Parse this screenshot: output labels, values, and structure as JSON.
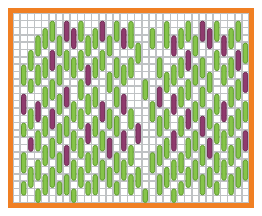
{
  "figure": {
    "title": "",
    "background": "#ffffff"
  },
  "frame": {
    "name": "orange-border-frame",
    "color": "#F07F23",
    "thickness": 5,
    "x": 8,
    "y": 8,
    "width": 246,
    "height": 200
  },
  "plot": {
    "x": 13,
    "y": 13,
    "width": 236,
    "height": 190,
    "background": "#ffffff"
  },
  "grid": {
    "color": "#BFC2C4",
    "line_width": 1.6,
    "columns": 33,
    "rows": 26,
    "cell_width": 7.15,
    "cell_height": 7.3,
    "visible": true
  },
  "colors": {
    "green_fill": "#86C44A",
    "green_stroke": "#5E9B2C",
    "purple_fill": "#8F3B6E",
    "purple_stroke": "#6E2A53",
    "grid": "#BFC2C4",
    "border": "#F07F23",
    "background": "#ffffff"
  },
  "chart_data": {
    "type": "heatmap",
    "title": "",
    "xlabel": "",
    "ylabel": "",
    "legend": [
      {
        "label": "green-capsule",
        "color": "#86C44A"
      },
      {
        "label": "purple-capsule",
        "color": "#8F3B6E"
      }
    ],
    "grid_columns": 33,
    "grid_rows": 26,
    "marks": [
      {
        "col": 1,
        "row": 7,
        "len": 3,
        "color": "green"
      },
      {
        "col": 1,
        "row": 11,
        "len": 3,
        "color": "purple"
      },
      {
        "col": 1,
        "row": 15,
        "len": 2,
        "color": "green"
      },
      {
        "col": 1,
        "row": 19,
        "len": 3,
        "color": "green"
      },
      {
        "col": 1,
        "row": 23,
        "len": 2,
        "color": "green"
      },
      {
        "col": 2,
        "row": 5,
        "len": 3,
        "color": "green"
      },
      {
        "col": 2,
        "row": 9,
        "len": 2,
        "color": "green"
      },
      {
        "col": 2,
        "row": 13,
        "len": 3,
        "color": "green"
      },
      {
        "col": 2,
        "row": 17,
        "len": 2,
        "color": "purple"
      },
      {
        "col": 2,
        "row": 21,
        "len": 3,
        "color": "green"
      },
      {
        "col": 3,
        "row": 3,
        "len": 3,
        "color": "green"
      },
      {
        "col": 3,
        "row": 7,
        "len": 3,
        "color": "green"
      },
      {
        "col": 3,
        "row": 12,
        "len": 3,
        "color": "purple"
      },
      {
        "col": 3,
        "row": 16,
        "len": 3,
        "color": "green"
      },
      {
        "col": 3,
        "row": 20,
        "len": 3,
        "color": "green"
      },
      {
        "col": 3,
        "row": 24,
        "len": 2,
        "color": "green"
      },
      {
        "col": 4,
        "row": 2,
        "len": 3,
        "color": "green"
      },
      {
        "col": 4,
        "row": 6,
        "len": 3,
        "color": "green"
      },
      {
        "col": 4,
        "row": 10,
        "len": 3,
        "color": "green"
      },
      {
        "col": 4,
        "row": 14,
        "len": 3,
        "color": "green"
      },
      {
        "col": 4,
        "row": 18,
        "len": 3,
        "color": "green"
      },
      {
        "col": 4,
        "row": 22,
        "len": 3,
        "color": "green"
      },
      {
        "col": 5,
        "row": 1,
        "len": 3,
        "color": "green"
      },
      {
        "col": 5,
        "row": 5,
        "len": 3,
        "color": "purple"
      },
      {
        "col": 5,
        "row": 9,
        "len": 3,
        "color": "green"
      },
      {
        "col": 5,
        "row": 13,
        "len": 3,
        "color": "purple"
      },
      {
        "col": 5,
        "row": 17,
        "len": 3,
        "color": "green"
      },
      {
        "col": 5,
        "row": 21,
        "len": 3,
        "color": "green"
      },
      {
        "col": 6,
        "row": 3,
        "len": 3,
        "color": "green"
      },
      {
        "col": 6,
        "row": 7,
        "len": 3,
        "color": "green"
      },
      {
        "col": 6,
        "row": 11,
        "len": 3,
        "color": "green"
      },
      {
        "col": 6,
        "row": 15,
        "len": 3,
        "color": "green"
      },
      {
        "col": 6,
        "row": 19,
        "len": 3,
        "color": "green"
      },
      {
        "col": 6,
        "row": 23,
        "len": 2,
        "color": "green"
      },
      {
        "col": 7,
        "row": 1,
        "len": 3,
        "color": "purple"
      },
      {
        "col": 7,
        "row": 5,
        "len": 3,
        "color": "green"
      },
      {
        "col": 7,
        "row": 10,
        "len": 3,
        "color": "purple"
      },
      {
        "col": 7,
        "row": 14,
        "len": 3,
        "color": "green"
      },
      {
        "col": 7,
        "row": 18,
        "len": 3,
        "color": "purple"
      },
      {
        "col": 7,
        "row": 22,
        "len": 3,
        "color": "green"
      },
      {
        "col": 8,
        "row": 2,
        "len": 3,
        "color": "purple"
      },
      {
        "col": 8,
        "row": 6,
        "len": 3,
        "color": "green"
      },
      {
        "col": 8,
        "row": 12,
        "len": 3,
        "color": "green"
      },
      {
        "col": 8,
        "row": 16,
        "len": 3,
        "color": "green"
      },
      {
        "col": 8,
        "row": 20,
        "len": 3,
        "color": "green"
      },
      {
        "col": 8,
        "row": 24,
        "len": 2,
        "color": "green"
      },
      {
        "col": 9,
        "row": 1,
        "len": 3,
        "color": "green"
      },
      {
        "col": 9,
        "row": 5,
        "len": 3,
        "color": "green"
      },
      {
        "col": 9,
        "row": 9,
        "len": 3,
        "color": "green"
      },
      {
        "col": 9,
        "row": 13,
        "len": 3,
        "color": "green"
      },
      {
        "col": 9,
        "row": 17,
        "len": 3,
        "color": "green"
      },
      {
        "col": 9,
        "row": 21,
        "len": 3,
        "color": "green"
      },
      {
        "col": 10,
        "row": 3,
        "len": 3,
        "color": "green"
      },
      {
        "col": 10,
        "row": 7,
        "len": 3,
        "color": "purple"
      },
      {
        "col": 10,
        "row": 11,
        "len": 3,
        "color": "green"
      },
      {
        "col": 10,
        "row": 15,
        "len": 3,
        "color": "purple"
      },
      {
        "col": 10,
        "row": 19,
        "len": 3,
        "color": "green"
      },
      {
        "col": 10,
        "row": 23,
        "len": 2,
        "color": "green"
      },
      {
        "col": 11,
        "row": 2,
        "len": 3,
        "color": "green"
      },
      {
        "col": 11,
        "row": 6,
        "len": 3,
        "color": "green"
      },
      {
        "col": 11,
        "row": 10,
        "len": 3,
        "color": "green"
      },
      {
        "col": 11,
        "row": 14,
        "len": 3,
        "color": "green"
      },
      {
        "col": 11,
        "row": 18,
        "len": 3,
        "color": "green"
      },
      {
        "col": 11,
        "row": 22,
        "len": 3,
        "color": "green"
      },
      {
        "col": 12,
        "row": 1,
        "len": 3,
        "color": "purple"
      },
      {
        "col": 12,
        "row": 5,
        "len": 3,
        "color": "green"
      },
      {
        "col": 12,
        "row": 12,
        "len": 3,
        "color": "purple"
      },
      {
        "col": 12,
        "row": 16,
        "len": 3,
        "color": "green"
      },
      {
        "col": 12,
        "row": 20,
        "len": 3,
        "color": "green"
      },
      {
        "col": 13,
        "row": 3,
        "len": 3,
        "color": "green"
      },
      {
        "col": 13,
        "row": 8,
        "len": 3,
        "color": "green"
      },
      {
        "col": 13,
        "row": 13,
        "len": 3,
        "color": "green"
      },
      {
        "col": 13,
        "row": 17,
        "len": 3,
        "color": "purple"
      },
      {
        "col": 13,
        "row": 21,
        "len": 3,
        "color": "green"
      },
      {
        "col": 14,
        "row": 1,
        "len": 3,
        "color": "green"
      },
      {
        "col": 14,
        "row": 6,
        "len": 3,
        "color": "green"
      },
      {
        "col": 14,
        "row": 10,
        "len": 3,
        "color": "green"
      },
      {
        "col": 14,
        "row": 14,
        "len": 3,
        "color": "green"
      },
      {
        "col": 14,
        "row": 19,
        "len": 3,
        "color": "green"
      },
      {
        "col": 14,
        "row": 23,
        "len": 2,
        "color": "green"
      },
      {
        "col": 15,
        "row": 2,
        "len": 3,
        "color": "purple"
      },
      {
        "col": 15,
        "row": 7,
        "len": 3,
        "color": "green"
      },
      {
        "col": 15,
        "row": 11,
        "len": 3,
        "color": "purple"
      },
      {
        "col": 15,
        "row": 16,
        "len": 3,
        "color": "purple"
      },
      {
        "col": 15,
        "row": 20,
        "len": 3,
        "color": "green"
      },
      {
        "col": 16,
        "row": 1,
        "len": 4,
        "color": "green"
      },
      {
        "col": 16,
        "row": 6,
        "len": 3,
        "color": "green"
      },
      {
        "col": 16,
        "row": 13,
        "len": 3,
        "color": "green"
      },
      {
        "col": 16,
        "row": 18,
        "len": 3,
        "color": "green"
      },
      {
        "col": 16,
        "row": 22,
        "len": 3,
        "color": "green"
      },
      {
        "col": 17,
        "row": 4,
        "len": 3,
        "color": "green"
      },
      {
        "col": 17,
        "row": 15,
        "len": 3,
        "color": "purple"
      },
      {
        "col": 17,
        "row": 21,
        "len": 3,
        "color": "green"
      },
      {
        "col": 18,
        "row": 9,
        "len": 3,
        "color": "green"
      },
      {
        "col": 18,
        "row": 24,
        "len": 2,
        "color": "green"
      },
      {
        "col": 19,
        "row": 2,
        "len": 3,
        "color": "green"
      },
      {
        "col": 19,
        "row": 12,
        "len": 3,
        "color": "green"
      },
      {
        "col": 19,
        "row": 19,
        "len": 3,
        "color": "green"
      },
      {
        "col": 20,
        "row": 6,
        "len": 3,
        "color": "green"
      },
      {
        "col": 20,
        "row": 10,
        "len": 3,
        "color": "purple"
      },
      {
        "col": 20,
        "row": 14,
        "len": 3,
        "color": "green"
      },
      {
        "col": 20,
        "row": 18,
        "len": 3,
        "color": "green"
      },
      {
        "col": 20,
        "row": 22,
        "len": 3,
        "color": "green"
      },
      {
        "col": 21,
        "row": 1,
        "len": 4,
        "color": "green"
      },
      {
        "col": 21,
        "row": 8,
        "len": 3,
        "color": "green"
      },
      {
        "col": 21,
        "row": 13,
        "len": 3,
        "color": "green"
      },
      {
        "col": 21,
        "row": 17,
        "len": 3,
        "color": "green"
      },
      {
        "col": 21,
        "row": 21,
        "len": 3,
        "color": "green"
      },
      {
        "col": 22,
        "row": 3,
        "len": 3,
        "color": "purple"
      },
      {
        "col": 22,
        "row": 7,
        "len": 3,
        "color": "green"
      },
      {
        "col": 22,
        "row": 11,
        "len": 3,
        "color": "purple"
      },
      {
        "col": 22,
        "row": 16,
        "len": 3,
        "color": "purple"
      },
      {
        "col": 22,
        "row": 20,
        "len": 3,
        "color": "green"
      },
      {
        "col": 22,
        "row": 24,
        "len": 2,
        "color": "green"
      },
      {
        "col": 23,
        "row": 2,
        "len": 3,
        "color": "green"
      },
      {
        "col": 23,
        "row": 6,
        "len": 3,
        "color": "green"
      },
      {
        "col": 23,
        "row": 10,
        "len": 3,
        "color": "green"
      },
      {
        "col": 23,
        "row": 14,
        "len": 3,
        "color": "green"
      },
      {
        "col": 23,
        "row": 19,
        "len": 3,
        "color": "green"
      },
      {
        "col": 23,
        "row": 23,
        "len": 2,
        "color": "green"
      },
      {
        "col": 24,
        "row": 1,
        "len": 3,
        "color": "green"
      },
      {
        "col": 24,
        "row": 5,
        "len": 3,
        "color": "purple"
      },
      {
        "col": 24,
        "row": 9,
        "len": 3,
        "color": "green"
      },
      {
        "col": 24,
        "row": 13,
        "len": 3,
        "color": "purple"
      },
      {
        "col": 24,
        "row": 17,
        "len": 3,
        "color": "green"
      },
      {
        "col": 24,
        "row": 21,
        "len": 3,
        "color": "green"
      },
      {
        "col": 25,
        "row": 3,
        "len": 3,
        "color": "green"
      },
      {
        "col": 25,
        "row": 7,
        "len": 3,
        "color": "green"
      },
      {
        "col": 25,
        "row": 12,
        "len": 3,
        "color": "green"
      },
      {
        "col": 25,
        "row": 16,
        "len": 3,
        "color": "green"
      },
      {
        "col": 25,
        "row": 20,
        "len": 3,
        "color": "green"
      },
      {
        "col": 26,
        "row": 1,
        "len": 3,
        "color": "purple"
      },
      {
        "col": 26,
        "row": 6,
        "len": 3,
        "color": "green"
      },
      {
        "col": 26,
        "row": 10,
        "len": 3,
        "color": "green"
      },
      {
        "col": 26,
        "row": 14,
        "len": 3,
        "color": "purple"
      },
      {
        "col": 26,
        "row": 18,
        "len": 3,
        "color": "green"
      },
      {
        "col": 26,
        "row": 22,
        "len": 3,
        "color": "green"
      },
      {
        "col": 27,
        "row": 2,
        "len": 3,
        "color": "purple"
      },
      {
        "col": 27,
        "row": 8,
        "len": 3,
        "color": "green"
      },
      {
        "col": 27,
        "row": 13,
        "len": 3,
        "color": "green"
      },
      {
        "col": 27,
        "row": 17,
        "len": 3,
        "color": "purple"
      },
      {
        "col": 27,
        "row": 21,
        "len": 3,
        "color": "green"
      },
      {
        "col": 28,
        "row": 1,
        "len": 3,
        "color": "green"
      },
      {
        "col": 28,
        "row": 5,
        "len": 3,
        "color": "green"
      },
      {
        "col": 28,
        "row": 11,
        "len": 3,
        "color": "green"
      },
      {
        "col": 28,
        "row": 15,
        "len": 3,
        "color": "green"
      },
      {
        "col": 28,
        "row": 19,
        "len": 3,
        "color": "green"
      },
      {
        "col": 28,
        "row": 23,
        "len": 2,
        "color": "green"
      },
      {
        "col": 29,
        "row": 3,
        "len": 3,
        "color": "purple"
      },
      {
        "col": 29,
        "row": 7,
        "len": 3,
        "color": "green"
      },
      {
        "col": 29,
        "row": 12,
        "len": 3,
        "color": "purple"
      },
      {
        "col": 29,
        "row": 16,
        "len": 3,
        "color": "green"
      },
      {
        "col": 29,
        "row": 20,
        "len": 3,
        "color": "green"
      },
      {
        "col": 30,
        "row": 2,
        "len": 3,
        "color": "green"
      },
      {
        "col": 30,
        "row": 6,
        "len": 3,
        "color": "green"
      },
      {
        "col": 30,
        "row": 10,
        "len": 3,
        "color": "green"
      },
      {
        "col": 30,
        "row": 14,
        "len": 3,
        "color": "green"
      },
      {
        "col": 30,
        "row": 18,
        "len": 3,
        "color": "green"
      },
      {
        "col": 30,
        "row": 22,
        "len": 3,
        "color": "green"
      },
      {
        "col": 31,
        "row": 1,
        "len": 3,
        "color": "green"
      },
      {
        "col": 31,
        "row": 5,
        "len": 3,
        "color": "purple"
      },
      {
        "col": 31,
        "row": 9,
        "len": 3,
        "color": "green"
      },
      {
        "col": 31,
        "row": 13,
        "len": 3,
        "color": "green"
      },
      {
        "col": 31,
        "row": 17,
        "len": 3,
        "color": "green"
      },
      {
        "col": 31,
        "row": 21,
        "len": 3,
        "color": "green"
      },
      {
        "col": 32,
        "row": 4,
        "len": 3,
        "color": "green"
      },
      {
        "col": 32,
        "row": 8,
        "len": 3,
        "color": "purple"
      },
      {
        "col": 32,
        "row": 12,
        "len": 3,
        "color": "green"
      },
      {
        "col": 32,
        "row": 16,
        "len": 3,
        "color": "purple"
      },
      {
        "col": 32,
        "row": 20,
        "len": 3,
        "color": "green"
      }
    ]
  }
}
